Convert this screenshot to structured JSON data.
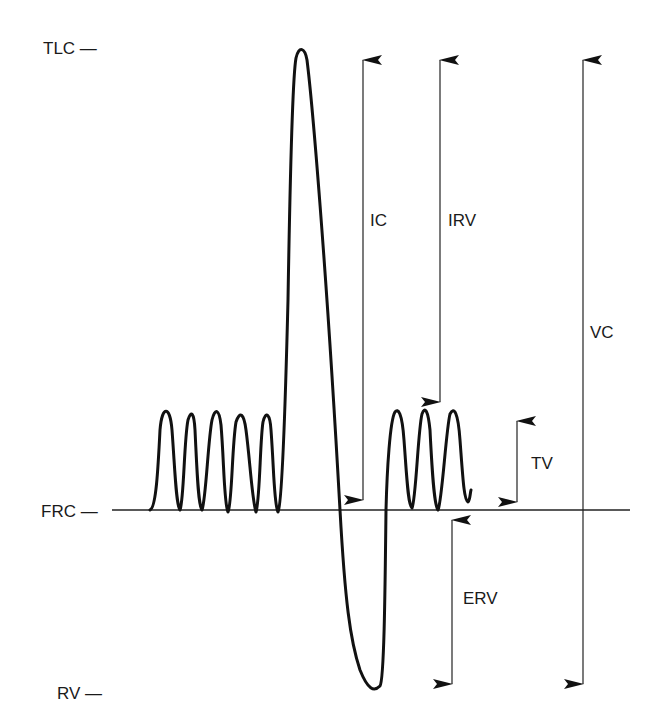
{
  "diagram": {
    "title": "",
    "type": "spirogram-lung-volumes",
    "level_labels": {
      "tlc": "TLC —",
      "frc": "FRC —",
      "rv": "RV —"
    },
    "volume_labels": {
      "ic": "IC",
      "irv": "IRV",
      "vc": "VC",
      "tv": "TV",
      "erv": "ERV"
    },
    "colors": {
      "trace": "#111111",
      "arrow": "#222222",
      "text": "#1a1a1a",
      "background": "#ffffff"
    },
    "arrows": [
      {
        "name": "IC",
        "from": "FRC",
        "to": "TLC",
        "bidirectional": true
      },
      {
        "name": "IRV",
        "from": "tidal peak",
        "to": "TLC",
        "bidirectional": true
      },
      {
        "name": "VC",
        "from": "RV",
        "to": "TLC",
        "bidirectional": true
      },
      {
        "name": "TV",
        "from": "FRC",
        "to": "tidal peak",
        "bidirectional": true
      },
      {
        "name": "ERV",
        "from": "RV",
        "to": "FRC",
        "bidirectional": true
      }
    ],
    "trace_description": "5 tidal breaths, maximal inspiration to TLC, maximal expiration to RV, then 3 tidal breaths"
  }
}
